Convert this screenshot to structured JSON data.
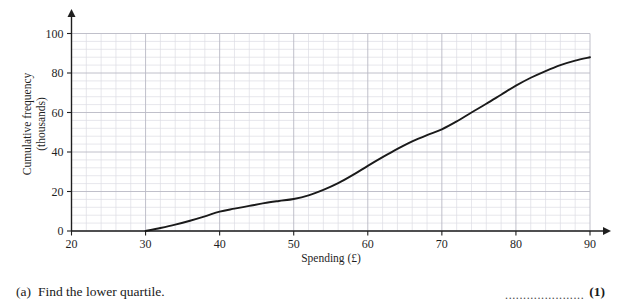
{
  "question": {
    "letter": "(a)",
    "text": "Find the lower quartile.",
    "dots": "......................",
    "marks": "(1)"
  },
  "chart_data": {
    "type": "line",
    "title": "",
    "xlabel": "Spending (£)",
    "ylabel_line1": "Cumulative frequency",
    "ylabel_line2": "(thousands)",
    "xlim": [
      20,
      90
    ],
    "ylim": [
      0,
      100
    ],
    "xticks": [
      20,
      30,
      40,
      50,
      60,
      70,
      80,
      90
    ],
    "xtick_labels": [
      "20",
      "30",
      "40",
      "50",
      "60",
      "70",
      "80",
      "90"
    ],
    "yticks": [
      0,
      20,
      40,
      60,
      80,
      100
    ],
    "ytick_labels": [
      "0",
      "20",
      "40",
      "60",
      "80",
      "100"
    ],
    "grid": true,
    "grid_major_step_x": 10,
    "grid_major_step_y": 20,
    "grid_minor_step_x": 2,
    "grid_minor_step_y": 4,
    "legend": "none",
    "series": [
      {
        "name": "Cumulative frequency",
        "x": [
          30,
          32,
          34,
          36,
          38,
          40,
          42,
          44,
          46,
          48,
          50,
          52,
          54,
          56,
          58,
          60,
          62,
          64,
          66,
          68,
          70,
          72,
          74,
          76,
          78,
          80,
          82,
          84,
          86,
          88,
          90
        ],
        "values": [
          0,
          1.5,
          3.2,
          5.2,
          7.4,
          9.8,
          11.3,
          12.7,
          14.1,
          15.2,
          16.2,
          18.0,
          20.8,
          24.2,
          28.4,
          33.0,
          37.4,
          41.6,
          45.4,
          48.6,
          51.5,
          55.5,
          60.0,
          64.4,
          69.0,
          73.6,
          77.6,
          81.0,
          84.0,
          86.3,
          88.0
        ]
      }
    ],
    "colors": {
      "curve": "#1a1a1a",
      "axis": "#1f1f1f",
      "grid_major": "#b9b9c4",
      "grid_minor": "#dcdce4"
    }
  }
}
